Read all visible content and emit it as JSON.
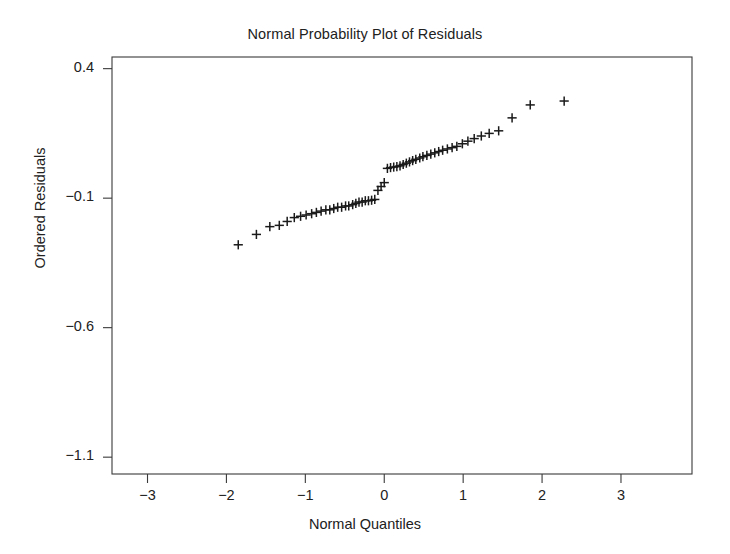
{
  "chart_data": {
    "type": "scatter",
    "title": "Normal Probability Plot of Residuals",
    "xlabel": "Normal Quantiles",
    "ylabel": "Ordered Residuals",
    "xlim": [
      -3,
      3
    ],
    "ylim": [
      -1.1,
      0.4
    ],
    "xticks": [
      -3,
      -2,
      -1,
      0,
      1,
      2,
      3
    ],
    "xtick_labels": [
      "-3",
      "-2",
      "-1",
      "0",
      "1",
      "2",
      "3"
    ],
    "yticks": [
      0.4,
      -0.1,
      -0.6,
      -1.1
    ],
    "ytick_labels": [
      "0.4",
      "-0.1",
      "-0.6",
      "-1.1"
    ],
    "grid": false,
    "legend": null,
    "marker": "plus",
    "marker_color": "#1a1a1a",
    "series": [
      {
        "name": "Ordered Residuals",
        "x": [
          -1.85,
          -1.62,
          -1.45,
          -1.33,
          -1.23,
          -1.14,
          -1.06,
          -0.99,
          -0.92,
          -0.86,
          -0.8,
          -0.74,
          -0.69,
          -0.64,
          -0.59,
          -0.54,
          -0.49,
          -0.45,
          -0.4,
          -0.36,
          -0.32,
          -0.28,
          -0.24,
          -0.2,
          -0.16,
          -0.12,
          -0.08,
          -0.04,
          0.0,
          0.04,
          0.08,
          0.12,
          0.16,
          0.2,
          0.24,
          0.28,
          0.32,
          0.36,
          0.4,
          0.45,
          0.49,
          0.54,
          0.59,
          0.64,
          0.69,
          0.74,
          0.8,
          0.86,
          0.92,
          0.99,
          1.06,
          1.14,
          1.23,
          1.33,
          1.45,
          1.62,
          1.85,
          2.28
        ],
        "y": [
          -0.28,
          -0.24,
          -0.21,
          -0.205,
          -0.19,
          -0.175,
          -0.17,
          -0.165,
          -0.16,
          -0.155,
          -0.15,
          -0.145,
          -0.145,
          -0.14,
          -0.135,
          -0.135,
          -0.13,
          -0.13,
          -0.125,
          -0.12,
          -0.115,
          -0.115,
          -0.11,
          -0.11,
          -0.108,
          -0.105,
          -0.07,
          -0.055,
          -0.04,
          0.015,
          0.018,
          0.02,
          0.022,
          0.025,
          0.03,
          0.035,
          0.04,
          0.045,
          0.05,
          0.055,
          0.06,
          0.065,
          0.07,
          0.075,
          0.08,
          0.085,
          0.09,
          0.095,
          0.1,
          0.11,
          0.12,
          0.13,
          0.14,
          0.15,
          0.16,
          0.21,
          0.26,
          0.275
        ]
      }
    ]
  }
}
